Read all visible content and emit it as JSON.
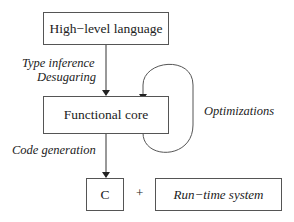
{
  "diagram": {
    "nodes": {
      "high_level": "High−level language",
      "functional_core": "Functional core",
      "c": "C",
      "runtime": "Run−time system"
    },
    "edges": {
      "type_inference": "Type inference",
      "desugaring": "Desugaring",
      "optimizations": "Optimizations",
      "code_generation": "Code generation"
    },
    "plus": "+"
  }
}
